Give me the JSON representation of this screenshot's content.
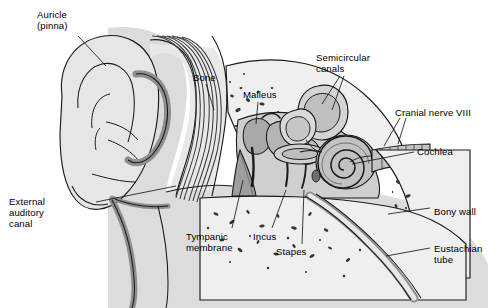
{
  "figure": {
    "type": "anatomical-diagram",
    "style": "grayscale line drawing",
    "background_color": "#ffffff",
    "line_color": "#1a1a1a",
    "palette": {
      "skin_light": "#e3e3e3",
      "skin_mid": "#d2d2d2",
      "cartilage_dark": "#9a9a9a",
      "bone_fill": "#ededed",
      "bone_speck": "#3a3a3a",
      "cochlea_fill": "#b8b8b8",
      "canal_fill": "#c9c9c9",
      "membrane_fill": "#a8a8a8",
      "nerve_fill": "#c0c0c0",
      "outline": "#1a1a1a"
    }
  },
  "labels": [
    {
      "id": "auricle",
      "text": "Auricle\n(pinna)",
      "x": 37,
      "y": 9,
      "align": "left"
    },
    {
      "id": "bone",
      "text": "Bone",
      "x": 193,
      "y": 72,
      "align": "left"
    },
    {
      "id": "malleus",
      "text": "Malleus",
      "x": 243,
      "y": 89,
      "align": "left"
    },
    {
      "id": "semicircular",
      "text": "Semicircular\ncanals",
      "x": 316,
      "y": 52,
      "align": "left"
    },
    {
      "id": "cranial-nerve",
      "text": "Cranial nerve VIII",
      "x": 395,
      "y": 107,
      "align": "left"
    },
    {
      "id": "cochlea",
      "text": "Cochlea",
      "x": 417,
      "y": 146,
      "align": "left"
    },
    {
      "id": "bony-wall",
      "text": "Bony wall",
      "x": 434,
      "y": 206,
      "align": "left"
    },
    {
      "id": "eustachian",
      "text": "Eustachian\ntube",
      "x": 434,
      "y": 243,
      "align": "left"
    },
    {
      "id": "stapes",
      "text": "Stapes",
      "x": 276,
      "y": 246,
      "align": "left"
    },
    {
      "id": "incus",
      "text": "Incus",
      "x": 253,
      "y": 231,
      "align": "left"
    },
    {
      "id": "tympanic",
      "text": "Tympanic\nmembrane",
      "x": 186,
      "y": 231,
      "align": "left"
    },
    {
      "id": "external-canal",
      "text": "External\nauditory\ncanal",
      "x": 9,
      "y": 196,
      "align": "left"
    }
  ],
  "structures": [
    {
      "id": "auricle-pinna",
      "name": "Auricle (pinna)"
    },
    {
      "id": "external-auditory-canal",
      "name": "External auditory canal"
    },
    {
      "id": "tympanic-membrane",
      "name": "Tympanic membrane"
    },
    {
      "id": "malleus-bone",
      "name": "Malleus"
    },
    {
      "id": "incus-bone",
      "name": "Incus"
    },
    {
      "id": "stapes-bone",
      "name": "Stapes"
    },
    {
      "id": "semicircular-canals",
      "name": "Semicircular canals"
    },
    {
      "id": "cochlea-spiral",
      "name": "Cochlea"
    },
    {
      "id": "cranial-nerve-viii",
      "name": "Cranial nerve VIII"
    },
    {
      "id": "eustachian-tube",
      "name": "Eustachian tube"
    },
    {
      "id": "temporal-bone",
      "name": "Bone / bony wall"
    }
  ]
}
